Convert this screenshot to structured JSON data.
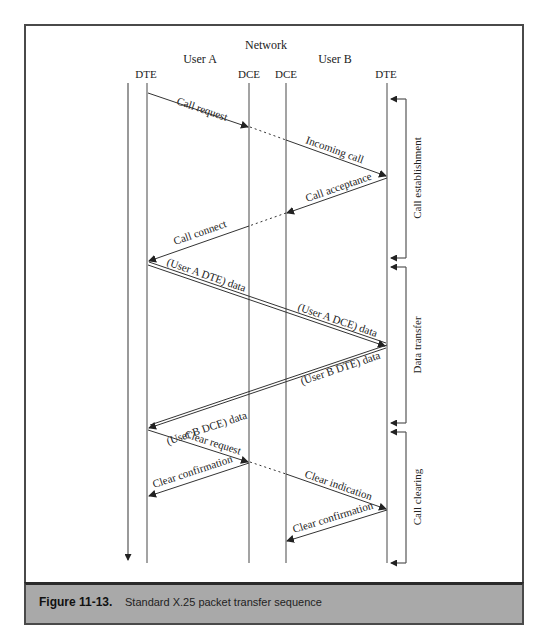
{
  "figure": {
    "number": "Figure 11-13.",
    "caption": "Standard X.25 packet transfer sequence"
  },
  "headers": {
    "network": "Network",
    "user_a": "User A",
    "user_b": "User B",
    "dte_a": "DTE",
    "dce_a": "DCE",
    "dce_b": "DCE",
    "dte_b": "DTE"
  },
  "messages": [
    {
      "label": "Call request",
      "from": "DTE A",
      "to": "DCE A"
    },
    {
      "label": "Incoming call",
      "from": "DCE B",
      "to": "DTE B"
    },
    {
      "label": "Call acceptance",
      "from": "DTE B",
      "to": "DCE B"
    },
    {
      "label": "Call connect",
      "from": "DCE A",
      "to": "DTE A"
    },
    {
      "label": "(User A DTE) data",
      "from": "DTE A",
      "to": "network"
    },
    {
      "label": "(User A DCE) data",
      "from": "network",
      "to": "DTE B"
    },
    {
      "label": "(User B DTE) data",
      "from": "DTE B",
      "to": "network"
    },
    {
      "label": "(User B DCE) data",
      "from": "network",
      "to": "DTE A"
    },
    {
      "label": "Clear request",
      "from": "DTE A",
      "to": "DCE A"
    },
    {
      "label": "Clear confirmation",
      "from": "DCE A",
      "to": "DTE A"
    },
    {
      "label": "Clear indication",
      "from": "DCE B",
      "to": "DTE B"
    },
    {
      "label": "Clear confirmation",
      "from": "DTE B",
      "to": "DCE B"
    }
  ],
  "phases": [
    {
      "label": "Call establishment"
    },
    {
      "label": "Data transfer"
    },
    {
      "label": "Call clearing"
    }
  ],
  "colors": {
    "line": "#555555",
    "arrow": "#222222",
    "caption_bg": "#a9a9a9"
  }
}
